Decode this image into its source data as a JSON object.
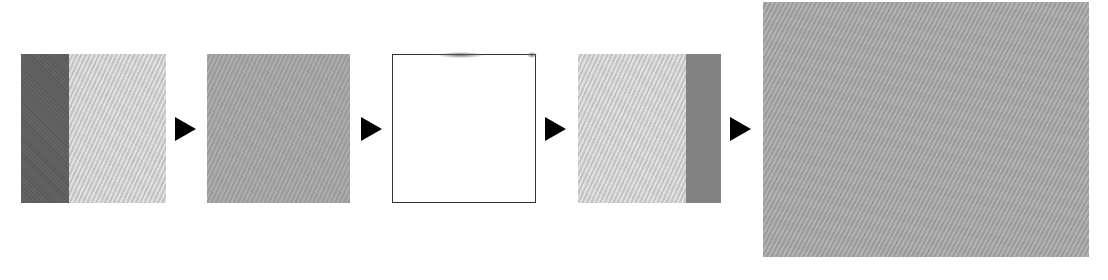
{
  "diagram": {
    "type": "process-flow",
    "direction": "left-to-right",
    "steps": [
      {
        "id": "step-1",
        "description": "square: dark gray left strip + light hatched gray area",
        "colors": {
          "strip": "#5e5e5e",
          "fill": "#cfcfcf"
        }
      },
      {
        "id": "step-2",
        "description": "uniform mid-gray hatched square",
        "colors": {
          "fill": "#a3a3a3"
        }
      },
      {
        "id": "step-3",
        "description": "blank white square with thin dark border",
        "colors": {
          "fill": "#ffffff",
          "border": "#333333"
        }
      },
      {
        "id": "step-4",
        "description": "square: light hatched gray area + gray right strip",
        "colors": {
          "fill": "#cfcfcf",
          "strip": "#828282"
        }
      },
      {
        "id": "step-5",
        "description": "large uniform gray hatched square (result)",
        "colors": {
          "fill": "#a5a5a5"
        }
      }
    ],
    "connectors": [
      {
        "from": "step-1",
        "to": "step-2",
        "glyph": "right-triangle-arrow",
        "color": "#000000"
      },
      {
        "from": "step-2",
        "to": "step-3",
        "glyph": "right-triangle-arrow",
        "color": "#000000"
      },
      {
        "from": "step-3",
        "to": "step-4",
        "glyph": "right-triangle-arrow",
        "color": "#000000"
      },
      {
        "from": "step-4",
        "to": "step-5",
        "glyph": "right-triangle-arrow",
        "color": "#000000"
      }
    ]
  }
}
